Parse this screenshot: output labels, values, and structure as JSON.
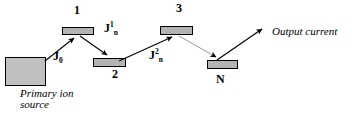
{
  "diagram": {
    "type": "schematic",
    "colors": {
      "plate_fill": "#b3b3b3",
      "source_fill": "#c0c0c0",
      "stroke": "#000000",
      "faint_stroke": "#8a8a8a",
      "background": "#ffffff"
    },
    "source": {
      "label_line1": "Primary ion",
      "label_line2": "source"
    },
    "stages": [
      {
        "id": "stage-1",
        "label": "1"
      },
      {
        "id": "stage-2",
        "label": "2"
      },
      {
        "id": "stage-3",
        "label": "3"
      },
      {
        "id": "stage-n",
        "label": "N"
      }
    ],
    "currents": [
      {
        "id": "j0",
        "base": "J",
        "sup": "",
        "sub": "0"
      },
      {
        "id": "j1n",
        "base": "J",
        "sup": "1",
        "sub": "n"
      },
      {
        "id": "j2n",
        "base": "J",
        "sup": "2",
        "sub": "n"
      }
    ],
    "output": {
      "label": "Output current"
    }
  }
}
